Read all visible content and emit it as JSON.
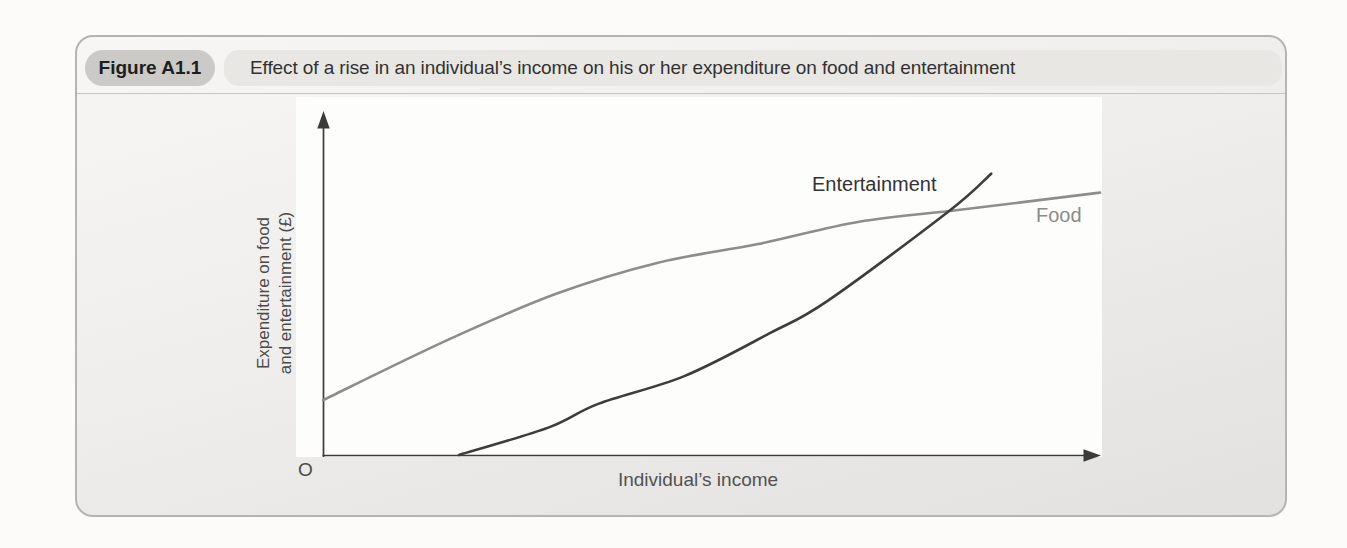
{
  "figure": {
    "badge_label": "Figure A1.1",
    "title": "Effect of a rise in an individual’s income on his or her expenditure on food and entertainment"
  },
  "chart": {
    "ylabel_lines": [
      "Expenditure on food",
      "and entertainment (£)"
    ],
    "xlabel": "Individual’s income",
    "origin_label": "O"
  },
  "colors": {
    "axis": "#3b3b3b",
    "food_line": "#8d8d8b",
    "entertainment_line": "#3d3d3d",
    "card_border": "#b5b4b2",
    "badge_bg": "#cbcac7",
    "title_band_bg": "#e8e7e4",
    "panel_bg": "#fdfdfc"
  },
  "chart_data": {
    "type": "line",
    "title": "Effect of a rise in an individual’s income on his or her expenditure on food and entertainment",
    "xlabel": "Individual’s income",
    "ylabel": "Expenditure on food and entertainment (£)",
    "x_axis": {
      "range": [
        0,
        100
      ],
      "ticks": [],
      "qualitative": true,
      "origin_label": "O",
      "arrow": true
    },
    "y_axis": {
      "range": [
        0,
        100
      ],
      "ticks": [],
      "qualitative": true,
      "arrow": true
    },
    "grid": false,
    "legend": "labels placed beside curve ends",
    "series": [
      {
        "name": "Food",
        "color": "#8d8d8b",
        "shape": "concave (increasing at a decreasing rate)",
        "points": [
          [
            0,
            16
          ],
          [
            16,
            33.5
          ],
          [
            30,
            47
          ],
          [
            43,
            56
          ],
          [
            56,
            61.5
          ],
          [
            69,
            68
          ],
          [
            82,
            71.5
          ],
          [
            100,
            76.5
          ]
        ]
      },
      {
        "name": "Entertainment",
        "color": "#3d3d3d",
        "shape": "convex (increasing at an increasing rate), starts on x-axis and overtakes Food",
        "points": [
          [
            17.5,
            0
          ],
          [
            29,
            8
          ],
          [
            35.5,
            15
          ],
          [
            46.5,
            23
          ],
          [
            57.5,
            35.5
          ],
          [
            65,
            45
          ],
          [
            80.5,
            71
          ],
          [
            86,
            82
          ]
        ]
      }
    ],
    "annotations": [
      "curves cross at approximately x=80.5, y=71"
    ]
  }
}
